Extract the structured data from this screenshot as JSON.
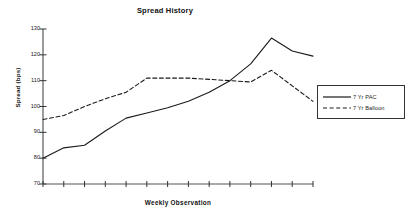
{
  "chart_data": {
    "type": "line",
    "title": "Spread History",
    "xlabel": "Weekly Observation",
    "ylabel": "Spread (bps)",
    "ylim": [
      70,
      130
    ],
    "yticks": [
      130,
      120,
      110,
      100,
      90,
      80,
      70
    ],
    "grid": false,
    "legend_position": "right",
    "x_tick_count": 14,
    "x_tick_labels": [],
    "x": [
      1,
      2,
      3,
      4,
      5,
      6,
      7,
      8,
      9,
      10,
      11,
      12,
      13,
      14
    ],
    "series": [
      {
        "name": "7 Yr PAC",
        "style": "solid",
        "color": "#1a1a1a",
        "values": [
          80,
          84,
          85,
          90.5,
          95.5,
          97.5,
          99.5,
          102,
          105.5,
          110,
          116.5,
          126.5,
          121.5,
          119.5
        ]
      },
      {
        "name": "7 Yr Balloon",
        "style": "dashed",
        "color": "#1a1a1a",
        "values": [
          95,
          96.5,
          100,
          103,
          105.5,
          111,
          111,
          111,
          110.5,
          110,
          109.5,
          114,
          108,
          102
        ]
      }
    ]
  },
  "legend": {
    "items": [
      {
        "label": "7 Yr PAC",
        "style": "solid"
      },
      {
        "label": "7 Yr Balloon",
        "style": "dashed"
      }
    ]
  },
  "axis": {
    "y_tick_labels": [
      "130",
      "120",
      "110",
      "100",
      "90",
      "80",
      "70"
    ]
  }
}
